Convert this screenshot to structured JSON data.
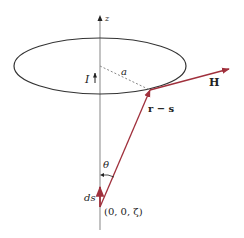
{
  "figure": {
    "type": "biot-savart-loop-diagram",
    "labels": {
      "z_axis": "z",
      "current": "I",
      "radius": "a",
      "field": "H",
      "displacement": "r − s",
      "angle": "θ",
      "element": "ds",
      "point": "(0, 0, ζ)"
    },
    "colors": {
      "vector": "#a0303c",
      "axis": "#9a9a9a",
      "loop": "#333333",
      "dashed": "#888888",
      "text": "#222222"
    },
    "geometry": {
      "axis_x": 100,
      "axis_top": 17,
      "axis_bottom": 230,
      "loop_center": [
        100,
        66
      ],
      "loop_rx": 86,
      "loop_ry": 28,
      "loop_point": [
        150,
        90
      ],
      "source_point": [
        100,
        207
      ],
      "h_tip": [
        229,
        69
      ]
    }
  }
}
